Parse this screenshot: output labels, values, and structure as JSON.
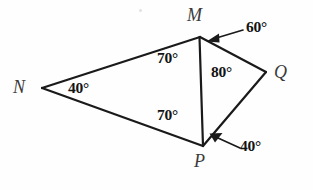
{
  "figure": {
    "background_color": "#fefefe",
    "stroke_color": "#1a1a1a"
  },
  "vertices": [
    {
      "name": "N",
      "label": "N",
      "x": 42,
      "y": 88
    },
    {
      "name": "M",
      "label": "M",
      "x": 200,
      "y": 37
    },
    {
      "name": "P",
      "label": "P",
      "x": 203,
      "y": 146
    },
    {
      "name": "Q",
      "label": "Q",
      "x": 266,
      "y": 72
    }
  ],
  "segments": [
    {
      "name": "segment-NM",
      "from": "N",
      "to": "M"
    },
    {
      "name": "segment-NP",
      "from": "N",
      "to": "P"
    },
    {
      "name": "segment-MP",
      "from": "M",
      "to": "P"
    },
    {
      "name": "segment-MQ",
      "from": "M",
      "to": "Q"
    },
    {
      "name": "segment-QP",
      "from": "Q",
      "to": "P"
    }
  ],
  "angles": {
    "angle_at_N": "40°",
    "angle_NMP": "70°",
    "angle_NPM": "70°",
    "angle_QMP": "60°",
    "angle_MQP": "80°",
    "angle_QPM": "40°"
  },
  "labels": {
    "vertex_N": "N",
    "vertex_M": "M",
    "vertex_P": "P",
    "vertex_Q": "Q"
  }
}
